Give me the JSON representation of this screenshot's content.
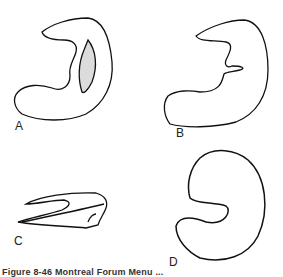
{
  "figure": {
    "panels": [
      {
        "id": "A",
        "label": "A",
        "description": "stomach outline with shaded lesion on lesser curvature"
      },
      {
        "id": "B",
        "label": "B",
        "description": "stomach outline with irregular notch on lesser curvature"
      },
      {
        "id": "C",
        "label": "C",
        "description": "flattened profile view of stomach"
      },
      {
        "id": "D",
        "label": "D",
        "description": "rounded C-shaped stomach outline"
      }
    ],
    "caption": "Figure 8-46  Montreal Forum Menu ..."
  }
}
